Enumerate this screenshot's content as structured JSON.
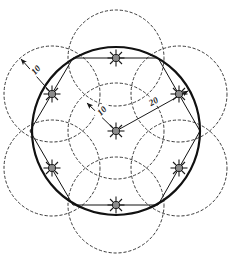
{
  "diagram": {
    "icon_name": "sprinkler-head-icon",
    "colors": {
      "outline": "#111111",
      "dashed": "#3a3a3a",
      "sprinkler_fill": "#8c8c8c",
      "sprinkler_stroke": "#1a1a1a",
      "background": "#ffffff",
      "dimension_line": "#1a1a1a"
    },
    "geometry": {
      "main_circle": {
        "cx": 116,
        "cy": 131,
        "r": 84
      },
      "coverage_radius": 48,
      "hexagon_vertices": [
        {
          "x": 73,
          "y": 58
        },
        {
          "x": 158,
          "y": 58
        },
        {
          "x": 200,
          "y": 131
        },
        {
          "x": 158,
          "y": 205
        },
        {
          "x": 73,
          "y": 205
        },
        {
          "x": 30,
          "y": 131
        }
      ],
      "sprinklers": [
        {
          "x": 116,
          "y": 131,
          "label": "center-sprinkler"
        },
        {
          "x": 116,
          "y": 58,
          "label": "top-sprinkler"
        },
        {
          "x": 179,
          "y": 94,
          "label": "upper-right-sprinkler"
        },
        {
          "x": 179,
          "y": 168,
          "label": "lower-right-sprinkler"
        },
        {
          "x": 116,
          "y": 205,
          "label": "bottom-sprinkler"
        },
        {
          "x": 52,
          "y": 168,
          "label": "lower-left-sprinkler"
        },
        {
          "x": 52,
          "y": 94,
          "label": "upper-left-sprinkler"
        }
      ],
      "coverage_circle_centers": [
        {
          "x": 116,
          "y": 131
        },
        {
          "x": 116,
          "y": 58
        },
        {
          "x": 179,
          "y": 94
        },
        {
          "x": 179,
          "y": 168
        },
        {
          "x": 116,
          "y": 205
        },
        {
          "x": 52,
          "y": 168
        },
        {
          "x": 52,
          "y": 94
        }
      ]
    },
    "dimensions": [
      {
        "name": "upper-left-radius-dimension",
        "value": "10",
        "from": {
          "x": 52,
          "y": 94
        },
        "to": {
          "x": 21,
          "y": 59
        },
        "label_x": 38,
        "label_y": 72,
        "label_rotation": -48
      },
      {
        "name": "center-radius-dimension",
        "value": "10",
        "from": {
          "x": 116,
          "y": 131
        },
        "to": {
          "x": 87,
          "y": 103
        },
        "label_x": 104,
        "label_y": 113,
        "label_rotation": -45
      },
      {
        "name": "center-to-vertex-dimension",
        "value": "20",
        "from": {
          "x": 116,
          "y": 131
        },
        "to": {
          "x": 188,
          "y": 91
        },
        "label_x": 155,
        "label_y": 104,
        "label_rotation": -30
      }
    ]
  }
}
